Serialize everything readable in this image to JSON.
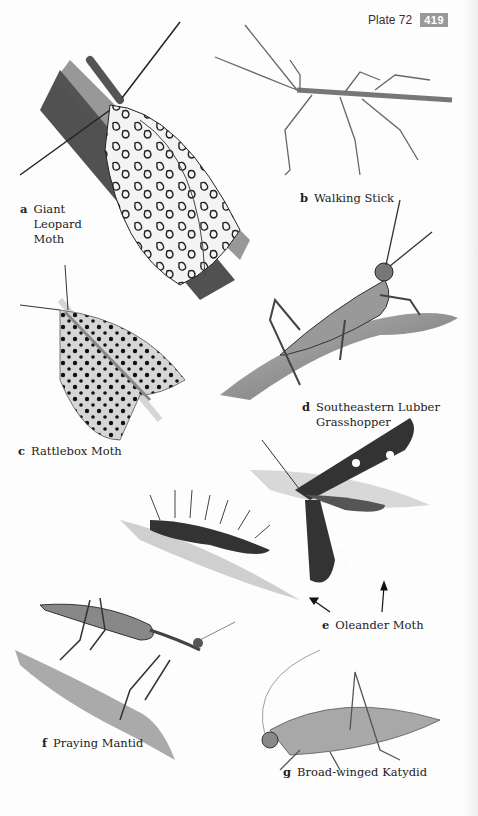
{
  "header": {
    "plate_label": "Plate 72",
    "page_number": "419"
  },
  "colors": {
    "page_number_bg": "#999999",
    "ink": "#1a1a1a"
  },
  "species": [
    {
      "letter": "a",
      "name": "Giant Leopard Moth"
    },
    {
      "letter": "b",
      "name": "Walking Stick"
    },
    {
      "letter": "c",
      "name": "Rattlebox Moth"
    },
    {
      "letter": "d",
      "name": "Southeastern Lubber Grasshopper"
    },
    {
      "letter": "e",
      "name": "Oleander Moth"
    },
    {
      "letter": "f",
      "name": "Praying Mantid"
    },
    {
      "letter": "g",
      "name": "Broad-winged Katydid"
    }
  ],
  "label_lines": {
    "a": [
      "Giant",
      "Leopard",
      "Moth"
    ],
    "d": [
      "Southeastern Lubber",
      "Grasshopper"
    ]
  }
}
